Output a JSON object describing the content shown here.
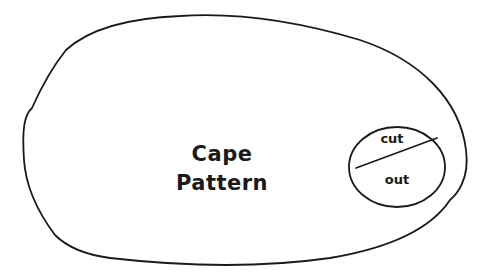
{
  "diagram": {
    "title_line1": "Cape",
    "title_line2": "Pattern",
    "marker_top": "cut",
    "marker_bottom": "out",
    "stroke_color": "#1a1a1a",
    "background_color": "#ffffff"
  }
}
